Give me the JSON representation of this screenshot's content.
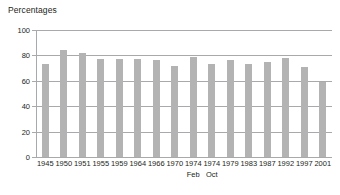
{
  "chart_data": {
    "type": "bar",
    "title": "Percentages",
    "xlabel": "",
    "ylabel": "",
    "ylim": [
      0,
      100
    ],
    "yticks": [
      0,
      20,
      40,
      60,
      80,
      100
    ],
    "grid": true,
    "legend": false,
    "legend_position": "none",
    "bar_color": "#b3b3b3",
    "axis_color": "#a7a9ac",
    "text_color": "#231f20",
    "categories": [
      "1945",
      "1950",
      "1951",
      "1955",
      "1959",
      "1964",
      "1966",
      "1970",
      "1974",
      "1974",
      "1979",
      "1983",
      "1987",
      "1992",
      "1997",
      "2001"
    ],
    "sublabels": [
      "",
      "",
      "",
      "",
      "",
      "",
      "",
      "",
      "Feb",
      "Oct",
      "",
      "",
      "",
      "",
      "",
      ""
    ],
    "values": [
      73,
      84,
      82,
      77,
      77,
      77,
      76,
      72,
      79,
      73,
      76,
      73,
      75,
      78,
      71,
      59
    ]
  }
}
